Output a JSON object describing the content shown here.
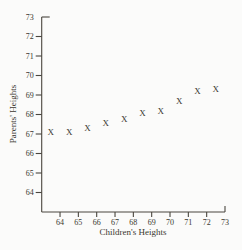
{
  "figure": {
    "background": "#fbfbfa",
    "ink_color": "#3a372f",
    "axis_color": "#4a463e"
  },
  "chart_data": {
    "type": "scatter",
    "title": "",
    "xlabel": "Children's Heights",
    "ylabel": "Parents' Heights",
    "marker_glyph": "X",
    "xlim": [
      63,
      73
    ],
    "ylim": [
      63,
      73
    ],
    "x_ticks": [
      64,
      65,
      66,
      67,
      68,
      69,
      70,
      71,
      72,
      73
    ],
    "y_ticks": [
      64,
      65,
      66,
      67,
      68,
      69,
      70,
      71,
      72,
      73
    ],
    "grid": false,
    "legend": "none",
    "points": [
      {
        "x": 63.5,
        "y": 67.1
      },
      {
        "x": 64.5,
        "y": 67.1
      },
      {
        "x": 65.5,
        "y": 67.3
      },
      {
        "x": 66.5,
        "y": 67.6
      },
      {
        "x": 67.5,
        "y": 67.8
      },
      {
        "x": 68.5,
        "y": 68.1
      },
      {
        "x": 69.5,
        "y": 68.2
      },
      {
        "x": 70.5,
        "y": 68.7
      },
      {
        "x": 71.5,
        "y": 69.2
      },
      {
        "x": 72.5,
        "y": 69.3
      }
    ]
  }
}
